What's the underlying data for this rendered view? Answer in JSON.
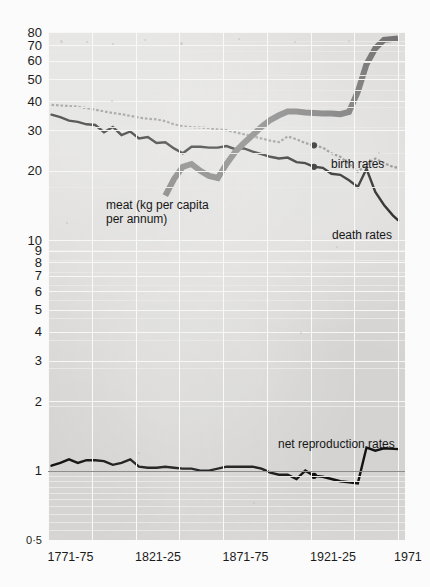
{
  "figure": {
    "background_color": "#fbfbfb",
    "plot_background_color": "#dddcdb",
    "grid": "on",
    "scale": "log"
  },
  "axes": {
    "y_ticks": [
      "80",
      "70",
      "60",
      "50",
      "40",
      "30",
      "20",
      "10",
      "9",
      "8",
      "7",
      "6",
      "5",
      "4",
      "3",
      "2",
      "1",
      "0·5"
    ],
    "y_tick_values": [
      80,
      70,
      60,
      50,
      40,
      30,
      20,
      10,
      9,
      8,
      7,
      6,
      5,
      4,
      3,
      2,
      1,
      0.5
    ],
    "x_ticks": [
      "1771-75",
      "1821-25",
      "1871-75",
      "1921-25",
      "1971"
    ],
    "x_tick_values": [
      1773,
      1823,
      1873,
      1923,
      1971
    ]
  },
  "annotations": {
    "meat": "meat (kg per capita\nper annum)",
    "birth": "birth rates",
    "death": "death rates",
    "nrr": "net reproduction rates"
  },
  "chart_data": {
    "type": "line",
    "title": "",
    "xlabel": "",
    "ylabel": "",
    "scale": "log",
    "ylim": [
      0.5,
      80
    ],
    "xlim": [
      1771,
      1975
    ],
    "grid": true,
    "legend_position": "inline-labels",
    "series": [
      {
        "name": "birth rates",
        "style": "dotted-grey",
        "color": "#8a8a8a",
        "units": "per 1000 population",
        "points": [
          [
            1773,
            38.6
          ],
          [
            1778,
            38.4
          ],
          [
            1783,
            38.2
          ],
          [
            1788,
            37.9
          ],
          [
            1793,
            37.4
          ],
          [
            1798,
            36.8
          ],
          [
            1803,
            36.2
          ],
          [
            1808,
            35.6
          ],
          [
            1813,
            35.2
          ],
          [
            1818,
            34.6
          ],
          [
            1823,
            34.0
          ],
          [
            1828,
            33.6
          ],
          [
            1833,
            33.4
          ],
          [
            1838,
            32.8
          ],
          [
            1843,
            31.8
          ],
          [
            1848,
            31.2
          ],
          [
            1853,
            30.9
          ],
          [
            1858,
            30.8
          ],
          [
            1863,
            30.6
          ],
          [
            1868,
            30.2
          ],
          [
            1873,
            30.0
          ],
          [
            1878,
            29.4
          ],
          [
            1883,
            28.8
          ],
          [
            1888,
            28.2
          ],
          [
            1893,
            27.6
          ],
          [
            1898,
            27.0
          ],
          [
            1903,
            26.6
          ],
          [
            1908,
            28.2
          ],
          [
            1913,
            27.4
          ],
          [
            1918,
            26.4
          ],
          [
            1923,
            25.8
          ],
          [
            1928,
            25.2
          ],
          [
            1933,
            23.8
          ],
          [
            1938,
            23.0
          ],
          [
            1943,
            21.4
          ],
          [
            1948,
            19.8
          ],
          [
            1953,
            21.2
          ],
          [
            1958,
            22.6
          ],
          [
            1963,
            21.6
          ],
          [
            1968,
            20.8
          ],
          [
            1971,
            20.6
          ]
        ]
      },
      {
        "name": "death rates",
        "style": "solid-black",
        "color": "#141414",
        "units": "per 1000 population",
        "points": [
          [
            1773,
            35.0
          ],
          [
            1778,
            34.2
          ],
          [
            1783,
            33.0
          ],
          [
            1788,
            32.6
          ],
          [
            1793,
            31.8
          ],
          [
            1798,
            31.6
          ],
          [
            1803,
            29.4
          ],
          [
            1808,
            31.0
          ],
          [
            1813,
            28.6
          ],
          [
            1818,
            29.6
          ],
          [
            1823,
            27.6
          ],
          [
            1828,
            28.0
          ],
          [
            1833,
            26.4
          ],
          [
            1838,
            26.6
          ],
          [
            1843,
            25.0
          ],
          [
            1848,
            23.8
          ],
          [
            1853,
            25.4
          ],
          [
            1858,
            25.4
          ],
          [
            1863,
            25.2
          ],
          [
            1868,
            25.2
          ],
          [
            1873,
            25.6
          ],
          [
            1878,
            24.8
          ],
          [
            1883,
            25.0
          ],
          [
            1888,
            24.2
          ],
          [
            1893,
            23.6
          ],
          [
            1898,
            23.0
          ],
          [
            1903,
            22.6
          ],
          [
            1908,
            22.8
          ],
          [
            1913,
            21.8
          ],
          [
            1918,
            21.6
          ],
          [
            1923,
            20.8
          ],
          [
            1928,
            20.6
          ],
          [
            1933,
            19.4
          ],
          [
            1938,
            19.2
          ],
          [
            1943,
            18.2
          ],
          [
            1948,
            17.0
          ],
          [
            1953,
            20.4
          ],
          [
            1958,
            16.2
          ],
          [
            1963,
            14.2
          ],
          [
            1968,
            12.8
          ],
          [
            1971,
            12.2
          ]
        ]
      },
      {
        "name": "meat (kg per capita per annum)",
        "style": "thick-grey",
        "color": "#6e6e6e",
        "units": "kg per capita per annum",
        "points": [
          [
            1838,
            15.6
          ],
          [
            1843,
            18.4
          ],
          [
            1848,
            20.8
          ],
          [
            1853,
            21.4
          ],
          [
            1858,
            20.0
          ],
          [
            1863,
            19.0
          ],
          [
            1868,
            18.6
          ],
          [
            1873,
            21.4
          ],
          [
            1878,
            24.2
          ],
          [
            1883,
            26.4
          ],
          [
            1888,
            28.6
          ],
          [
            1893,
            31.0
          ],
          [
            1898,
            33.2
          ],
          [
            1903,
            34.8
          ],
          [
            1908,
            36.2
          ],
          [
            1913,
            36.2
          ],
          [
            1918,
            35.8
          ],
          [
            1923,
            35.6
          ],
          [
            1928,
            35.4
          ],
          [
            1933,
            35.4
          ],
          [
            1938,
            35.2
          ],
          [
            1943,
            36.0
          ],
          [
            1948,
            44.0
          ],
          [
            1953,
            58.0
          ],
          [
            1958,
            68.0
          ],
          [
            1963,
            74.0
          ],
          [
            1971,
            75.0
          ]
        ]
      },
      {
        "name": "net reproduction rates",
        "style": "solid-black",
        "color": "#141414",
        "units": "ratio",
        "points": [
          [
            1773,
            1.05
          ],
          [
            1778,
            1.08
          ],
          [
            1783,
            1.12
          ],
          [
            1788,
            1.08
          ],
          [
            1793,
            1.11
          ],
          [
            1798,
            1.11
          ],
          [
            1803,
            1.1
          ],
          [
            1808,
            1.06
          ],
          [
            1813,
            1.08
          ],
          [
            1818,
            1.12
          ],
          [
            1823,
            1.04
          ],
          [
            1828,
            1.03
          ],
          [
            1833,
            1.03
          ],
          [
            1838,
            1.04
          ],
          [
            1843,
            1.03
          ],
          [
            1848,
            1.02
          ],
          [
            1853,
            1.02
          ],
          [
            1858,
            1.0
          ],
          [
            1863,
            1.0
          ],
          [
            1868,
            1.02
          ],
          [
            1873,
            1.04
          ],
          [
            1878,
            1.04
          ],
          [
            1883,
            1.04
          ],
          [
            1888,
            1.04
          ],
          [
            1893,
            1.02
          ],
          [
            1898,
            0.98
          ],
          [
            1903,
            0.96
          ],
          [
            1908,
            0.96
          ],
          [
            1913,
            0.92
          ],
          [
            1918,
            1.0
          ],
          [
            1923,
            0.95
          ],
          [
            1928,
            0.94
          ],
          [
            1933,
            0.92
          ],
          [
            1938,
            0.9
          ],
          [
            1943,
            0.89
          ],
          [
            1948,
            0.88
          ],
          [
            1953,
            1.26
          ],
          [
            1958,
            1.22
          ],
          [
            1963,
            1.25
          ],
          [
            1971,
            1.24
          ]
        ]
      }
    ]
  }
}
